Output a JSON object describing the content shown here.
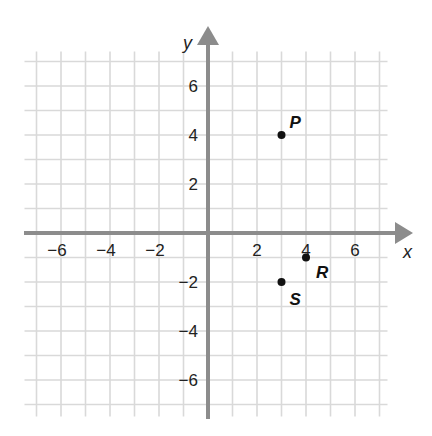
{
  "chart_data": {
    "type": "scatter",
    "title": "",
    "xlabel": "x",
    "ylabel": "y",
    "xlim": [
      -7,
      7
    ],
    "ylim": [
      -7,
      7
    ],
    "grid": true,
    "x_ticks": [
      -6,
      -4,
      -2,
      2,
      4,
      6
    ],
    "y_ticks": [
      6,
      4,
      2,
      -2,
      -4,
      -6
    ],
    "x_tick_labels": [
      "−6",
      "−4",
      "−2",
      "2",
      "4",
      "6"
    ],
    "y_tick_labels": [
      "6",
      "4",
      "2",
      "−2",
      "−4",
      "−6"
    ],
    "points": [
      {
        "label": "P",
        "x": 3,
        "y": 4
      },
      {
        "label": "R",
        "x": 4,
        "y": -1
      },
      {
        "label": "S",
        "x": 3,
        "y": -2
      }
    ]
  },
  "colors": {
    "grid": "#d9d9d9",
    "axis": "#8c8c8c",
    "point": "#111111",
    "text": "#222222"
  }
}
